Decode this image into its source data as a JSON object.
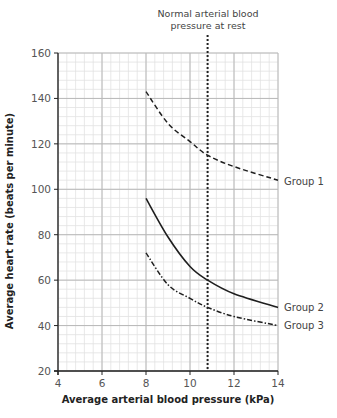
{
  "chart_data": {
    "type": "line",
    "title": "",
    "xlabel": "Average arterial blood pressure (kPa)",
    "ylabel": "Average heart rate (beats per minute)",
    "xlim": [
      4,
      14
    ],
    "ylim": [
      20,
      160
    ],
    "x_ticks": [
      4,
      6,
      8,
      10,
      12,
      14
    ],
    "y_ticks": [
      20,
      40,
      60,
      80,
      100,
      120,
      140,
      160
    ],
    "x_tick_labels": [
      "4",
      "6",
      "8",
      "10",
      "12",
      "14"
    ],
    "y_tick_labels": [
      "20",
      "40",
      "60",
      "80",
      "100",
      "120",
      "140",
      "160"
    ],
    "grid": true,
    "minor_grid": {
      "x_step": 0.4,
      "y_step": 4
    },
    "legend": "inline labels at right end of each curve",
    "x": [
      8,
      9,
      10,
      10.8,
      12,
      14
    ],
    "series": [
      {
        "name": "Group 1",
        "style": "dashed",
        "values": [
          143,
          129,
          121,
          115,
          110,
          104
        ]
      },
      {
        "name": "Group 2",
        "style": "solid",
        "values": [
          96,
          79,
          66,
          60,
          54,
          48
        ]
      },
      {
        "name": "Group 3",
        "style": "dash-dot",
        "values": [
          72,
          58,
          52,
          48,
          44,
          40
        ]
      }
    ],
    "annotations": [
      {
        "type": "vertical-dotted-line",
        "x": 10.8,
        "text_lines": [
          "Normal arterial blood",
          "pressure at rest"
        ]
      }
    ]
  },
  "labels": {
    "annotation_line1": "Normal arterial blood",
    "annotation_line2": "pressure at rest",
    "xlabel": "Average arterial blood pressure (kPa)",
    "ylabel": "Average heart rate (beats per minute)",
    "group1": "Group 1",
    "group2": "Group 2",
    "group3": "Group 3"
  }
}
